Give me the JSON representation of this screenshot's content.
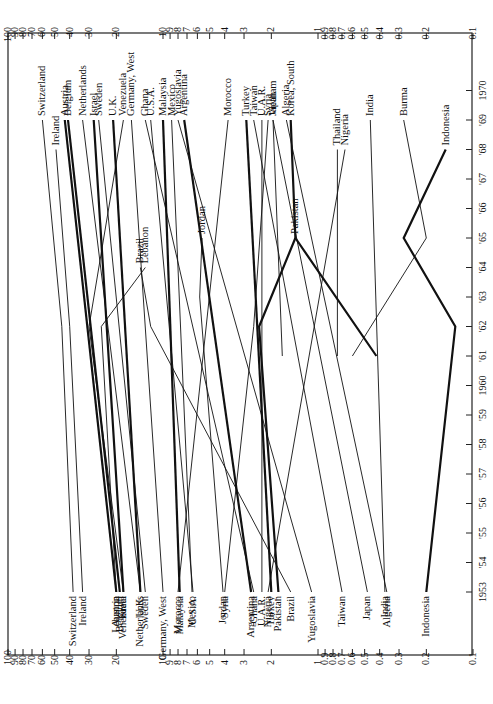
{
  "chart_data": {
    "type": "line",
    "orientation": "rotated-90-ccw",
    "title": "",
    "xlabel": "Year",
    "ylabel": "",
    "yscale": "log",
    "ylim": [
      0.1,
      100
    ],
    "xlim": [
      1953,
      1970
    ],
    "x_ticks": [
      "1953",
      "'54",
      "'55",
      "'56",
      "'57",
      "'58",
      "'59",
      "1960",
      "'61",
      "'62",
      "'63",
      "'64",
      "'65",
      "'66",
      "'67",
      "'68",
      "'69",
      "1970"
    ],
    "y_ticks": [
      "100",
      "90",
      "80",
      "70",
      "60",
      "50",
      "40",
      "30",
      "20",
      "10",
      "9",
      "8",
      "7",
      "6",
      "5",
      "4",
      "3",
      "2",
      "1",
      "0.9",
      "0.8",
      "0.7",
      "0.6",
      "0.5",
      "0.4",
      "0.3",
      "0.2",
      "0.1"
    ],
    "grid": false,
    "legend": "direct labels at line ends",
    "series": [
      {
        "name": "Switzerland",
        "bold": false,
        "points": [
          [
            1953,
            38
          ],
          [
            1962,
            45
          ],
          [
            1969,
            60
          ]
        ]
      },
      {
        "name": "Ireland",
        "bold": false,
        "points": [
          [
            1953,
            33
          ],
          [
            1962,
            40
          ],
          [
            1968,
            49
          ]
        ]
      },
      {
        "name": "Austria",
        "bold": true,
        "points": [
          [
            1953,
            20
          ],
          [
            1969,
            43
          ]
        ]
      },
      {
        "name": "Belgium",
        "bold": true,
        "points": [
          [
            1953,
            19
          ],
          [
            1969,
            41
          ]
        ]
      },
      {
        "name": "Netherlands",
        "bold": false,
        "points": [
          [
            1953,
            14
          ],
          [
            1969,
            33
          ]
        ]
      },
      {
        "name": "Israel",
        "bold": true,
        "points": [
          [
            1953,
            18
          ],
          [
            1969,
            28
          ]
        ]
      },
      {
        "name": "Sweden",
        "bold": false,
        "points": [
          [
            1953,
            13
          ],
          [
            1969,
            26
          ]
        ]
      },
      {
        "name": "U.K.",
        "bold": true,
        "points": [
          [
            1953,
            14
          ],
          [
            1969,
            21
          ]
        ]
      },
      {
        "name": "Venezuela",
        "bold": false,
        "points": [
          [
            1953,
            18
          ],
          [
            1962,
            30
          ],
          [
            1969,
            18
          ]
        ]
      },
      {
        "name": "Lebanon",
        "bold": false,
        "points": [
          [
            1953,
            20
          ],
          [
            1962,
            25
          ],
          [
            1964,
            13
          ]
        ]
      },
      {
        "name": "Germany, West",
        "bold": false,
        "points": [
          [
            1953,
            10
          ],
          [
            1969,
            16
          ]
        ]
      },
      {
        "name": "Ghana",
        "bold": false,
        "points": [
          [
            1953,
            2.6
          ],
          [
            1969,
            13
          ]
        ]
      },
      {
        "name": "U.S.A.",
        "bold": false,
        "points": [
          [
            1953,
            6.4
          ],
          [
            1969,
            12
          ]
        ]
      },
      {
        "name": "Malaysia",
        "bold": true,
        "points": [
          [
            1953,
            7.8
          ],
          [
            1969,
            10
          ]
        ]
      },
      {
        "name": "Mexico",
        "bold": false,
        "points": [
          [
            1953,
            6.5
          ],
          [
            1969,
            8.8
          ]
        ]
      },
      {
        "name": "Yugoslavia",
        "bold": false,
        "points": [
          [
            1953,
            1.1
          ],
          [
            1969,
            8
          ]
        ]
      },
      {
        "name": "Argentina",
        "bold": true,
        "points": [
          [
            1953,
            2.7
          ],
          [
            1969,
            7.3
          ]
        ]
      },
      {
        "name": "Brazil",
        "bold": false,
        "points": [
          [
            1953,
            1.5
          ],
          [
            1962,
            12
          ],
          [
            1964,
            14
          ]
        ]
      },
      {
        "name": "Morocco",
        "bold": false,
        "points": [
          [
            1953,
            8
          ],
          [
            1969,
            3.8
          ]
        ]
      },
      {
        "name": "Jordan",
        "bold": false,
        "points": [
          [
            1953,
            4.1
          ],
          [
            1963,
            5.8
          ],
          [
            1965,
            5.6
          ]
        ]
      },
      {
        "name": "Syria",
        "bold": false,
        "points": [
          [
            1953,
            4.0
          ],
          [
            1962,
            2.6
          ],
          [
            1969,
            2.1
          ]
        ]
      },
      {
        "name": "Turkey",
        "bold": true,
        "points": [
          [
            1953,
            2.0
          ],
          [
            1969,
            2.9
          ]
        ]
      },
      {
        "name": "Taiwan",
        "bold": false,
        "points": [
          [
            1953,
            0.7
          ],
          [
            1969,
            2.6
          ]
        ]
      },
      {
        "name": "U.A.R.",
        "bold": false,
        "points": [
          [
            1953,
            2.3
          ],
          [
            1969,
            2.3
          ]
        ]
      },
      {
        "name": "Nigeria",
        "bold": false,
        "points": [
          [
            1953,
            2.1
          ],
          [
            1968,
            0.67
          ]
        ]
      },
      {
        "name": "Vietnam",
        "bold": false,
        "points": [
          [
            1961,
            1.7
          ],
          [
            1969,
            1.95
          ]
        ]
      },
      {
        "name": "Japan",
        "bold": false,
        "points": [
          [
            1953,
            0.48
          ],
          [
            1969,
            1.95
          ]
        ]
      },
      {
        "name": "India",
        "bold": false,
        "points": [
          [
            1953,
            0.37
          ],
          [
            1969,
            0.46
          ]
        ]
      },
      {
        "name": "Algeria",
        "bold": false,
        "points": [
          [
            1953,
            0.36
          ],
          [
            1969,
            1.6
          ]
        ]
      },
      {
        "name": "Pakistan",
        "bold": true,
        "points": [
          [
            1953,
            1.8
          ],
          [
            1962,
            2.4
          ],
          [
            1965,
            1.4
          ]
        ]
      },
      {
        "name": "Korea, South",
        "bold": true,
        "points": [
          [
            1961,
            0.42
          ],
          [
            1965,
            1.4
          ],
          [
            1969,
            1.5
          ]
        ]
      },
      {
        "name": "Thailand",
        "bold": false,
        "points": [
          [
            1961,
            0.75
          ],
          [
            1968,
            0.75
          ]
        ]
      },
      {
        "name": "Burma",
        "bold": false,
        "points": [
          [
            1961,
            0.6
          ],
          [
            1965,
            0.2
          ],
          [
            1969,
            0.28
          ]
        ]
      },
      {
        "name": "Indonesia",
        "bold": true,
        "points": [
          [
            1953,
            0.2
          ],
          [
            1962,
            0.13
          ],
          [
            1965,
            0.28
          ],
          [
            1968,
            0.15
          ]
        ]
      }
    ]
  },
  "labels": {
    "top": [
      "Switzerland",
      "Ireland",
      "Austria",
      "Belgium",
      "Netherlands",
      "Israel",
      "Sweden",
      "U.K.",
      "Venezuela",
      "Germany, West",
      "Ghana",
      "U.S.A.",
      "Malaysia",
      "Mexico",
      "Yugoslavia",
      "Argentina",
      "Morocco",
      "Turkey",
      "Taiwan",
      "U.A.R.",
      "Syria",
      "Japan; Vietnam",
      "Algeria",
      "Korea, South",
      "Thailand",
      "Nigeria",
      "India",
      "Burma",
      "Indonesia"
    ],
    "bottom": [
      "Switzerland",
      "Ireland",
      "Lebanon",
      "Austria",
      "Belgium",
      "Israel; Venezuela",
      "U.K.",
      "Netherlands",
      "Sweden",
      "Germany, West",
      "Morocco",
      "Malaysia",
      "Mexico",
      "U.S.A.",
      "Jordan",
      "Argentina",
      "Ghana",
      "U.A.R.",
      "Nigeria",
      "Turkey",
      "Pakistan",
      "Brazil",
      "Yugoslavia",
      "Taiwan",
      "Japan",
      "India",
      "Algeria",
      "Indonesia"
    ],
    "middle": [
      "Lebanon",
      "Brazil",
      "Jordan",
      "Syria",
      "Vietnam",
      "Pakistan",
      "Thailand",
      "Burma",
      "Korea, South"
    ]
  }
}
